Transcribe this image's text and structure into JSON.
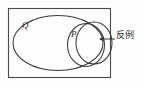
{
  "figure": {
    "type": "venn-diagram",
    "colors": {
      "background": "#fdfdfd",
      "stroke": "#3a3a3a",
      "border": "#4a4a4a",
      "text": "#2a2a2a"
    },
    "labels": {
      "set_outer": "Q",
      "set_inner": "P",
      "annotation": "反例"
    },
    "shapes": {
      "universe_rect": {
        "x": 8,
        "y": 8,
        "width": 102,
        "height": 70
      },
      "ellipse_q": {
        "cx": 58,
        "cy": 43,
        "rx": 45,
        "ry": 28
      },
      "circle_p": {
        "cx": 87,
        "cy": 45,
        "rx": 19,
        "ry": 22
      },
      "circle_counterexample": {
        "cx": 94,
        "cy": 43,
        "rx": 18,
        "ry": 21
      }
    },
    "leader": {
      "arrow_tip_x": 99,
      "arrow_y": 39,
      "line_end_x": 115
    }
  }
}
